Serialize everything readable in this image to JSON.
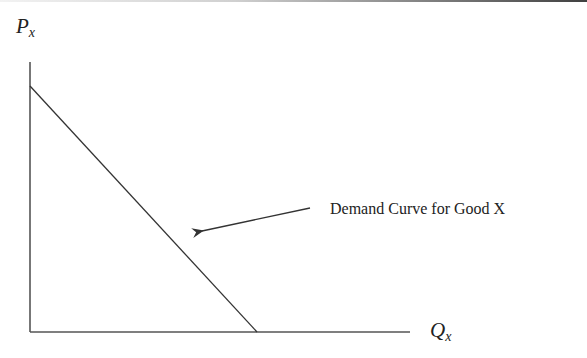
{
  "diagram": {
    "type": "economics-demand-curve",
    "y_axis": {
      "label_main": "P",
      "label_sub": "x"
    },
    "x_axis": {
      "label_main": "Q",
      "label_sub": "x"
    },
    "annotation": "Demand Curve for Good X",
    "colors": {
      "line": "#333333",
      "axis": "#555555",
      "text": "#222222"
    }
  }
}
